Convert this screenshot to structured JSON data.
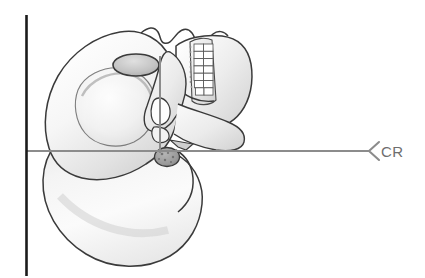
{
  "figure": {
    "background_color": "#ffffff"
  },
  "labels": {
    "central_ray": "CR"
  },
  "icons": {
    "arrowhead": "chevron-left-arrowhead-icon"
  },
  "colors": {
    "image_receptor_line": "#1b1b1b",
    "positioning_line": "#8c8c8c",
    "central_ray_line": "#8c8c8c",
    "label_text": "#6e6e6e",
    "bone_outline": "#3a3a3a",
    "bone_fill_light": "#fbfbfb",
    "bone_fill_mid": "#e3e3e3",
    "bone_fill_shadow": "#c9c9c9",
    "tooth_fill": "#ffffff",
    "tooth_outline": "#555555",
    "mastoid_fill": "#9a9a9a"
  },
  "geometry": {
    "image_receptor_line": {
      "orientation": "vertical",
      "x": 26,
      "y_start": 15,
      "y_end": 275,
      "stroke_width": 2.6
    },
    "central_ray_line": {
      "orientation": "horizontal",
      "y": 151,
      "x_start": 26,
      "x_end": 371,
      "stroke_width": 2.2
    },
    "vertical_positioning_line": {
      "orientation": "vertical",
      "x": 160,
      "y_start": 56,
      "y_end": 152,
      "stroke_width": 2.0
    },
    "arrowhead": {
      "tip_x": 369,
      "tip_y": 151,
      "back_x": 379,
      "half_height": 9
    },
    "cr_label_position": {
      "x": 379,
      "y": 157
    },
    "orbit": {
      "cx": 136,
      "cy": 65,
      "rx": 23,
      "ry": 11
    },
    "mastoid": {
      "cx": 167,
      "cy": 157,
      "rx": 12,
      "ry": 9
    }
  }
}
